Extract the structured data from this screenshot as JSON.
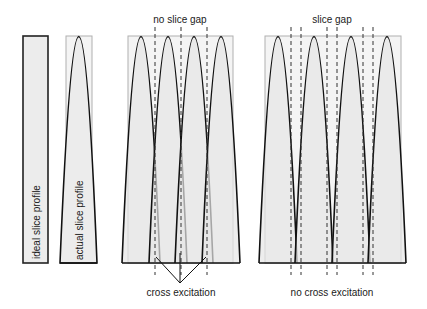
{
  "panels": {
    "ideal": {
      "label": "ideal slice profile"
    },
    "actual": {
      "label": "actual slice profile"
    },
    "no_gap": {
      "title": "no slice gap",
      "caption": "cross excitation",
      "bump_count": 4
    },
    "gap": {
      "title": "slice gap",
      "caption": "no cross excitation",
      "bump_count": 4
    }
  },
  "colors": {
    "fill": "#ececec",
    "frame": "#b0b0b0",
    "stroke": "#111111"
  }
}
